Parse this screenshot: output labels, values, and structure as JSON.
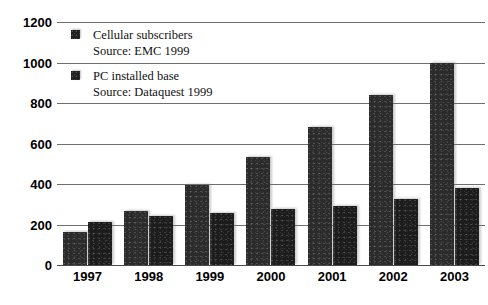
{
  "chart_data": {
    "type": "bar",
    "title": "",
    "subtitle": "",
    "xlabel": "",
    "ylabel": "",
    "categories": [
      "1997",
      "1998",
      "1999",
      "2000",
      "2001",
      "2002",
      "2003"
    ],
    "series": [
      {
        "name": "Cellular subscribers",
        "source": "Source: EMC 1999",
        "color": "#2b2b2b",
        "values": [
          163,
          265,
          395,
          535,
          680,
          840,
          1000
        ]
      },
      {
        "name": "PC installed base",
        "source": "Source: Dataquest 1999",
        "color": "#1c1c1c",
        "values": [
          213,
          240,
          255,
          275,
          290,
          325,
          380
        ]
      }
    ],
    "ylim": [
      0,
      1200
    ],
    "ytick_values": [
      0,
      200,
      400,
      600,
      800,
      1000,
      1200
    ],
    "ytick_labels": [
      "0",
      "200",
      "400",
      "600",
      "800",
      "1000",
      "1200"
    ],
    "grid": true,
    "grid_axis": "y",
    "legend_position": "upper-left-inside",
    "annotations": []
  },
  "legend": {
    "entries": [
      {
        "label": "Cellular subscribers",
        "source": "Source: EMC 1999",
        "swatch_name": "legend-swatch-cellular"
      },
      {
        "label": "PC installed base",
        "source": "Source: Dataquest 1999",
        "swatch_name": "legend-swatch-pc"
      }
    ]
  },
  "colors": {
    "bar_cellular": "#2b2b2b",
    "bar_pc": "#1c1c1c",
    "gridline": "#6e6e6e",
    "axis": "#4a4a4a",
    "text": "#000000",
    "background": "#ffffff"
  }
}
